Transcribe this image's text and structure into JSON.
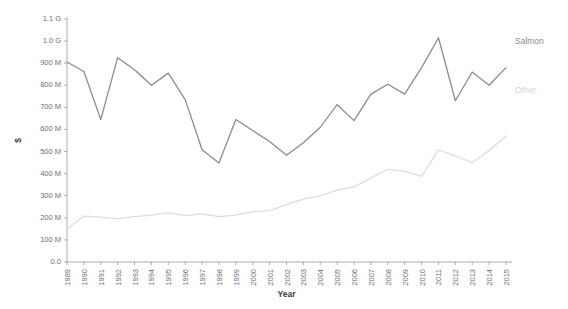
{
  "chart_data": {
    "type": "line",
    "title": "",
    "xlabel": "Year",
    "ylabel": "$",
    "xlim": [
      1989,
      2015
    ],
    "ylim": [
      0,
      1100000000
    ],
    "grid": false,
    "legend_position": "right-inline-labels",
    "x": [
      1989,
      1990,
      1991,
      1992,
      1993,
      1994,
      1995,
      1996,
      1997,
      1998,
      1999,
      2000,
      2001,
      2002,
      2003,
      2004,
      2005,
      2006,
      2007,
      2008,
      2009,
      2010,
      2011,
      2012,
      2013,
      2014,
      2015
    ],
    "xtick_labels": [
      "1989",
      "1990",
      "1991",
      "1992",
      "1993",
      "1994",
      "1995",
      "1996",
      "1997",
      "1998",
      "1999",
      "2000",
      "2001",
      "2002",
      "2003",
      "2004",
      "2005",
      "2006",
      "2007",
      "2008",
      "2009",
      "2010",
      "2011",
      "2012",
      "2013",
      "2014",
      "2015"
    ],
    "ytick_values": [
      0,
      100000000,
      200000000,
      300000000,
      400000000,
      500000000,
      600000000,
      700000000,
      800000000,
      900000000,
      1000000000,
      1100000000
    ],
    "ytick_labels": [
      "0.0",
      "100 M",
      "200 M",
      "300 M",
      "400 M",
      "500 M",
      "600 M",
      "700 M",
      "800 M",
      "900 M",
      "1.0 G",
      "1.1 G"
    ],
    "series": [
      {
        "name": "Salmon",
        "color": "#8a8a8a",
        "label_color": "#8a8a8a",
        "values": [
          905000000,
          862000000,
          645000000,
          925000000,
          870000000,
          800000000,
          855000000,
          735000000,
          508000000,
          448000000,
          645000000,
          595000000,
          545000000,
          483000000,
          540000000,
          610000000,
          712000000,
          640000000,
          760000000,
          805000000,
          760000000,
          880000000,
          1015000000,
          730000000,
          860000000,
          800000000,
          880000000
        ]
      },
      {
        "name": "Other",
        "color": "#dcdcdc",
        "label_color": "#d2d2d2",
        "values": [
          148000000,
          208000000,
          203000000,
          195000000,
          205000000,
          212000000,
          222000000,
          210000000,
          218000000,
          205000000,
          212000000,
          228000000,
          232000000,
          260000000,
          285000000,
          300000000,
          325000000,
          340000000,
          380000000,
          420000000,
          410000000,
          388000000,
          508000000,
          480000000,
          450000000,
          505000000,
          570000000
        ]
      }
    ]
  },
  "axis": {
    "y_title": "$",
    "x_title": "Year"
  },
  "colors": {
    "axis": "#9a9a9a",
    "tick_text": "#6e6e6e",
    "title_text": "#3b3b3b",
    "background": "#ffffff"
  }
}
